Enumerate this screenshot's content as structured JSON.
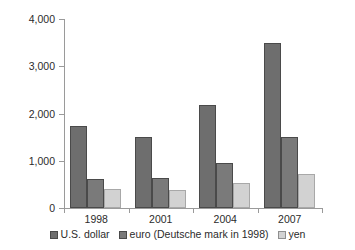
{
  "chart_data": {
    "type": "bar",
    "title": "",
    "subtitle": "",
    "xlabel": "",
    "ylabel": "daily average, $ billions",
    "categories": [
      "1998",
      "2001",
      "2004",
      "2007"
    ],
    "series": [
      {
        "name": "U.S. dollar",
        "values": [
          1740,
          1500,
          2180,
          3500
        ],
        "color": "#6e6e6e"
      },
      {
        "name": "euro (Deutsche mark in 1998)",
        "values": [
          610,
          630,
          950,
          1500
        ],
        "color": "#7a7a7a"
      },
      {
        "name": "yen",
        "values": [
          410,
          390,
          520,
          720
        ],
        "color": "#d2d2d2"
      }
    ],
    "ylim": [
      0,
      4000
    ],
    "yticks": [
      0,
      1000,
      2000,
      3000,
      4000
    ],
    "ytick_labels": [
      "0",
      "1,000",
      "2,000",
      "3,000",
      "4,000"
    ],
    "grid": false,
    "legend_position": "bottom"
  }
}
